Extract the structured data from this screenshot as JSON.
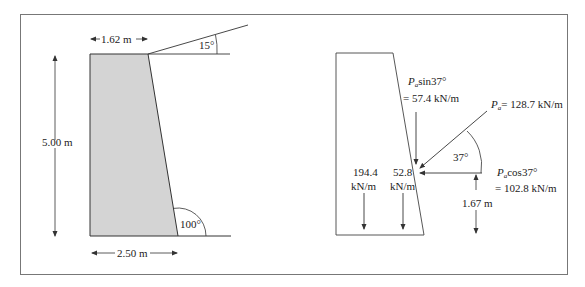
{
  "left_figure": {
    "top_width_label": "1.62 m",
    "height_label": "5.00 m",
    "base_width_label": "2.50 m",
    "backfill_angle_label": "15°",
    "back_face_angle_label": "100°"
  },
  "right_figure": {
    "pa_vertical_label_line1_sym": "P",
    "pa_vertical_label_line1_sub": "a",
    "pa_vertical_label_line1_rest": "sin37°",
    "pa_vertical_label_line2": "= 57.4 kN/m",
    "pa_sym": "P",
    "pa_sub": "a",
    "pa_rest": "= 128.7 kN/m",
    "angle_label": "37°",
    "pa_horizontal_label_line1_sym": "P",
    "pa_horizontal_label_line1_sub": "a",
    "pa_horizontal_label_line1_rest": "cos37°",
    "pa_horizontal_label_line2": "= 102.8 kN/m",
    "weight1_value": "194.4",
    "weight1_unit": "kN/m",
    "weight2_value": "52.8",
    "weight2_unit": "kN/m",
    "lever_arm_label": "1.67 m"
  },
  "colors": {
    "wall_fill": "#d4d4d4",
    "line": "#333333",
    "border": "#777777"
  }
}
